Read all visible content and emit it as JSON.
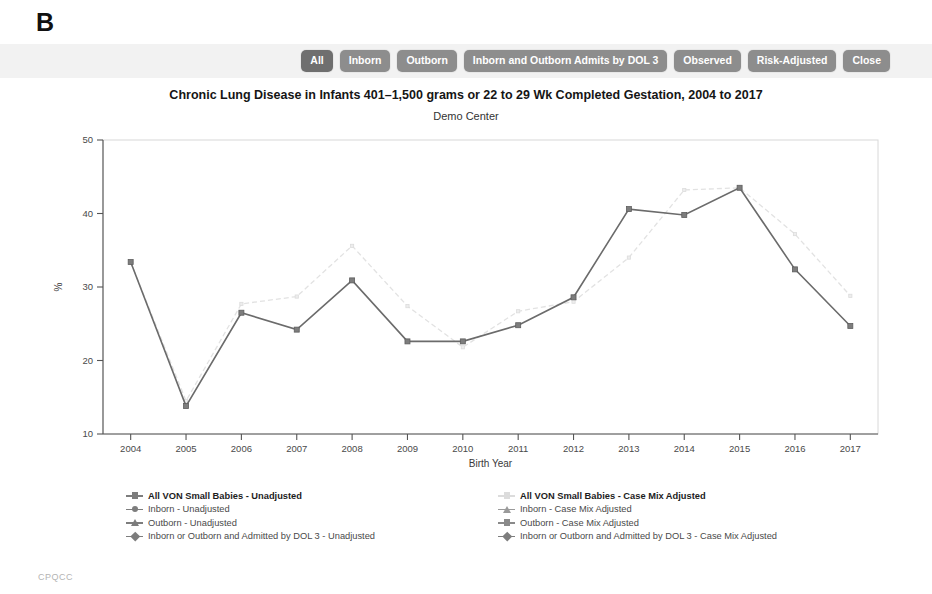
{
  "panel": {
    "letter": "B"
  },
  "toolbar": {
    "buttons": [
      {
        "label": "All",
        "active": true
      },
      {
        "label": "Inborn",
        "active": false
      },
      {
        "label": "Outborn",
        "active": false
      },
      {
        "label": "Inborn and Outborn Admits by DOL 3",
        "active": false
      },
      {
        "label": "Observed",
        "active": false
      },
      {
        "label": "Risk-Adjusted",
        "active": false
      },
      {
        "label": "Close",
        "active": false
      }
    ]
  },
  "footer": {
    "text": "CPQCC"
  },
  "colors": {
    "unadjusted": "#7d7d7d",
    "case_mix_adjusted": "#e2e2e2",
    "button": "#8d8d8d",
    "button_active": "#6f6f6f",
    "toolbar_bg": "#f2f2f2"
  },
  "legend": {
    "columns": [
      {
        "entries": [
          {
            "label": "All VON Small Babies - Unadjusted",
            "marker": "square",
            "color": "#7d7d7d",
            "bold": true
          },
          {
            "label": "Inborn - Unadjusted",
            "marker": "circle",
            "color": "#7d7d7d",
            "bold": false
          },
          {
            "label": "Outborn - Unadjusted",
            "marker": "triangle",
            "color": "#7d7d7d",
            "bold": false
          },
          {
            "label": "Inborn or Outborn and Admitted by DOL 3 - Unadjusted",
            "marker": "diamond",
            "color": "#7d7d7d",
            "bold": false
          }
        ]
      },
      {
        "entries": [
          {
            "label": "All VON Small Babies - Case Mix Adjusted",
            "marker": "square",
            "color": "#dcdcdc",
            "bold": true
          },
          {
            "label": "Inborn - Case Mix Adjusted",
            "marker": "triangle",
            "color": "#9a9a9a",
            "bold": false
          },
          {
            "label": "Outborn - Case Mix Adjusted",
            "marker": "square",
            "color": "#8a8a8a",
            "bold": false
          },
          {
            "label": "Inborn or Outborn and Admitted by DOL 3 - Case Mix Adjusted",
            "marker": "diamond",
            "color": "#7d7d7d",
            "bold": false
          }
        ]
      }
    ]
  },
  "chart_data": {
    "type": "line",
    "title": "Chronic Lung Disease in Infants 401–1,500 grams or 22 to 29 Wk Completed Gestation, 2004 to 2017",
    "subtitle": "Demo Center",
    "xlabel": "Birth Year",
    "ylabel": "%",
    "categories": [
      2004,
      2005,
      2006,
      2007,
      2008,
      2009,
      2010,
      2011,
      2012,
      2013,
      2014,
      2015,
      2016,
      2017
    ],
    "tick_labels": [
      "2004",
      "2005",
      "2006",
      "2007",
      "2008",
      "2009",
      "2010",
      "2011",
      "2012",
      "2013",
      "2014",
      "2015",
      "2016",
      "2017"
    ],
    "ylim": [
      10,
      50
    ],
    "yticks": [
      10,
      20,
      30,
      40,
      50
    ],
    "grid": false,
    "legend_position": "below",
    "series": [
      {
        "name": "All VON Small Babies - Unadjusted",
        "marker": "square",
        "color": "#7d7d7d",
        "linestyle": "solid",
        "values": [
          33.4,
          13.8,
          26.5,
          24.2,
          30.9,
          22.6,
          22.6,
          24.8,
          28.6,
          40.6,
          39.8,
          43.5,
          32.4,
          24.7
        ]
      },
      {
        "name": "All VON Small Babies - Case Mix Adjusted",
        "marker": "square",
        "color": "#e2e2e2",
        "linestyle": "dashed",
        "values": [
          33.4,
          14.5,
          27.7,
          28.7,
          35.6,
          27.4,
          21.8,
          26.7,
          28.0,
          34.0,
          43.2,
          43.5,
          37.2,
          28.8
        ]
      }
    ]
  }
}
